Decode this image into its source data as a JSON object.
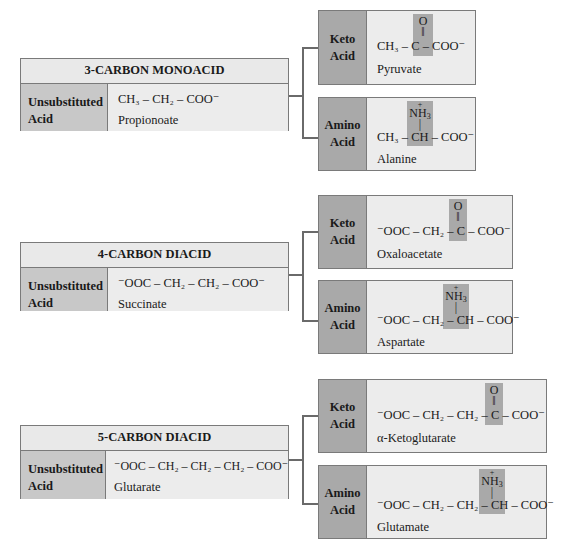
{
  "blocks": [
    {
      "title": "3-CARBON MONOACID",
      "unsub_label_1": "Unsubstituted",
      "unsub_label_2": "Acid",
      "unsub_formula": "CH₃ – CH₂ – COO⁻",
      "unsub_name": "Propionoate",
      "keto_label_1": "Keto",
      "keto_label_2": "Acid",
      "keto_prefix": "CH₃ –",
      "keto_center": "C",
      "keto_top": "O",
      "keto_bond": "‖",
      "keto_suffix": "– COO⁻",
      "keto_name": "Pyruvate",
      "amino_label_1": "Amino",
      "amino_label_2": "Acid",
      "amino_prefix": "CH₃ –",
      "amino_center": "CH",
      "amino_top": "N̈H₃",
      "amino_top_charge": "+",
      "amino_bond": "|",
      "amino_suffix": "– COO⁻",
      "amino_name": "Alanine"
    },
    {
      "title": "4-CARBON DIACID",
      "unsub_label_1": "Unsubstituted",
      "unsub_label_2": "Acid",
      "unsub_formula": "⁻OOC – CH₂ – CH₂ – COO⁻",
      "unsub_name": "Succinate",
      "keto_label_1": "Keto",
      "keto_label_2": "Acid",
      "keto_prefix": "⁻OOC – CH₂ –",
      "keto_center": "C",
      "keto_top": "O",
      "keto_bond": "‖",
      "keto_suffix": "– COO⁻",
      "keto_name": "Oxaloacetate",
      "amino_label_1": "Amino",
      "amino_label_2": "Acid",
      "amino_prefix": "⁻OOC – CH₂ –",
      "amino_center": "CH",
      "amino_top": "NH₃",
      "amino_top_charge": "+",
      "amino_bond": "|",
      "amino_suffix": "– COO⁻",
      "amino_name": "Aspartate"
    },
    {
      "title": "5-CARBON DIACID",
      "unsub_label_1": "Unsubstituted",
      "unsub_label_2": "Acid",
      "unsub_formula": "⁻OOC – CH₂ – CH₂ – CH₂ – COO⁻",
      "unsub_name": "Glutarate",
      "keto_label_1": "Keto",
      "keto_label_2": "Acid",
      "keto_prefix": "⁻OOC – CH₂ – CH₂ –",
      "keto_center": "C",
      "keto_top": "O",
      "keto_bond": "‖",
      "keto_suffix": "– COO⁻",
      "keto_name": "α-Ketoglutarate",
      "amino_label_1": "Amino",
      "amino_label_2": "Acid",
      "amino_prefix": "⁻OOC – CH₂ – CH₂ –",
      "amino_center": "CH",
      "amino_top": "NH₃",
      "amino_top_charge": "+",
      "amino_bond": "|",
      "amino_suffix": "– COO⁻",
      "amino_name": "Glutamate"
    }
  ],
  "colors": {
    "title_bg": "#e9e9e9",
    "unsub_label_bg": "#c8c8c8",
    "derived_label_bg": "#a9a9a9",
    "content_bg": "#ececec",
    "highlight": "#a9a9a9",
    "border": "#7a7a7a"
  }
}
